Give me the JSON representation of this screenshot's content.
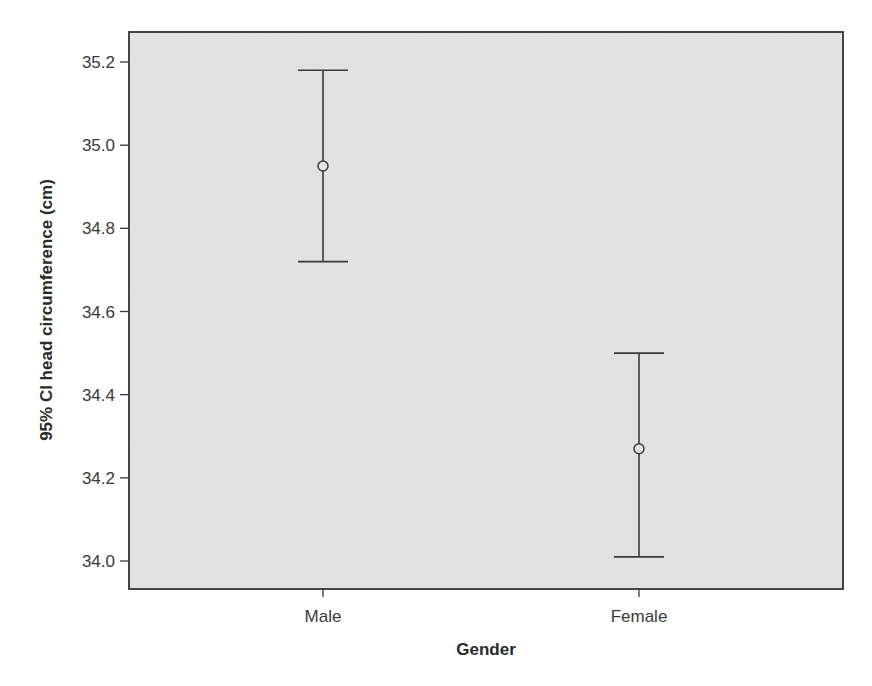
{
  "chart_data": {
    "type": "errorbar",
    "title": "",
    "xlabel": "Gender",
    "ylabel": "95% CI head circumference (cm)",
    "categories": [
      "Male",
      "Female"
    ],
    "series": [
      {
        "name": "95% CI head circumference (cm)",
        "mean": [
          34.95,
          34.27
        ],
        "ci_lower": [
          34.72,
          34.01
        ],
        "ci_upper": [
          35.18,
          34.5
        ]
      }
    ],
    "yticks": [
      34.0,
      34.2,
      34.4,
      34.6,
      34.8,
      35.0,
      35.2
    ],
    "ytick_labels": [
      "34.0",
      "34.2",
      "34.4",
      "34.6",
      "34.8",
      "35.0",
      "35.2"
    ],
    "ylim": [
      33.93,
      35.27
    ],
    "grid": false,
    "legend": "none",
    "colors": {
      "plot_background": "#e3e3e3",
      "page_background": "#ffffff",
      "line": "#3a3a3a"
    }
  }
}
